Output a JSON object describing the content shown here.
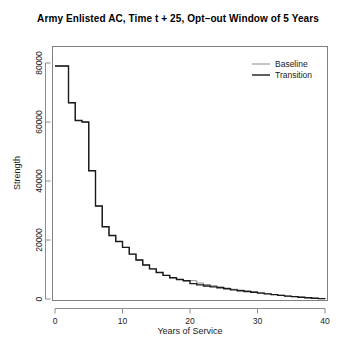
{
  "chart_data": {
    "type": "line",
    "title": "Army Enlisted AC, Time t + 25, Opt–out Window of 5 Years",
    "xlabel": "Years of Service",
    "ylabel": "Strength",
    "xlim": [
      0,
      40
    ],
    "ylim": [
      0,
      80000
    ],
    "xticks": [
      0,
      10,
      20,
      30,
      40
    ],
    "xticklabels": [
      "0",
      "10",
      "20",
      "30",
      "40"
    ],
    "yticks": [
      0,
      20000,
      40000,
      60000,
      80000
    ],
    "yticklabels": [
      "0",
      "20000",
      "40000",
      "60000",
      "80000"
    ],
    "grid": false,
    "step_style": "post",
    "legend": {
      "position": "top-right",
      "entries": [
        {
          "name": "Baseline",
          "color": "#8a8a8a",
          "width": 1.0
        },
        {
          "name": "Transition",
          "color": "#1a1a1a",
          "width": 1.4
        }
      ]
    },
    "x": [
      0,
      1,
      2,
      3,
      4,
      5,
      6,
      7,
      8,
      9,
      10,
      11,
      12,
      13,
      14,
      15,
      16,
      17,
      18,
      19,
      20,
      21,
      22,
      23,
      24,
      25,
      26,
      27,
      28,
      29,
      30,
      31,
      32,
      33,
      34,
      35,
      36,
      37,
      38,
      39,
      40
    ],
    "series": [
      {
        "name": "Baseline",
        "color": "#8a8a8a",
        "values": [
          79000,
          79000,
          66500,
          60500,
          60000,
          43500,
          31500,
          24500,
          21500,
          19500,
          17500,
          15200,
          13200,
          11500,
          10200,
          9000,
          8000,
          7200,
          6600,
          6200,
          6200,
          5400,
          4900,
          4500,
          4100,
          3700,
          3300,
          3000,
          2700,
          2400,
          2100,
          1800,
          1500,
          1250,
          1000,
          800,
          600,
          420,
          260,
          140,
          80
        ]
      },
      {
        "name": "Transition",
        "color": "#1a1a1a",
        "values": [
          79000,
          79000,
          66500,
          60500,
          60000,
          43500,
          31500,
          24500,
          21500,
          19500,
          17500,
          15200,
          13200,
          11500,
          10200,
          9000,
          8000,
          7200,
          6600,
          6200,
          5200,
          4800,
          4400,
          4100,
          3800,
          3450,
          3100,
          2800,
          2550,
          2300,
          2000,
          1750,
          1480,
          1230,
          990,
          790,
          590,
          415,
          255,
          138,
          78
        ]
      }
    ]
  }
}
